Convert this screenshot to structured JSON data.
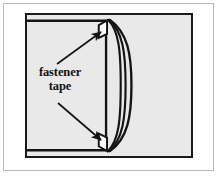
{
  "figure": {
    "kind": "technical-illustration",
    "background_color": "#ffffff",
    "plate_fill_color": "#e9e9e9",
    "plate_border_color": "#1a1a1a",
    "outer_frame_color": "#b9b9b9",
    "ink_color": "#141414",
    "tape_fill_color": "#ffffff"
  },
  "label": {
    "line1": "fastener",
    "line2": "tape"
  },
  "callouts": [
    {
      "id": "upper-callout",
      "name": "upper-fastener-tape-leader",
      "points_to": "upper-fastener-tape",
      "direction": "up-right"
    },
    {
      "id": "lower-callout",
      "name": "lower-fastener-tape-leader",
      "points_to": "lower-fastener-tape",
      "direction": "down-right"
    }
  ],
  "parts": [
    {
      "id": "upper-fastener-tape",
      "name": "upper fastener tape",
      "shape": "tab"
    },
    {
      "id": "lower-fastener-tape",
      "name": "lower fastener tape",
      "shape": "tab"
    },
    {
      "id": "panel-edge",
      "name": "panel edge",
      "shape": "vertical-line"
    },
    {
      "id": "folded-flap",
      "name": "folded flap",
      "shape": "curved-lines",
      "line_count": 3
    }
  ]
}
